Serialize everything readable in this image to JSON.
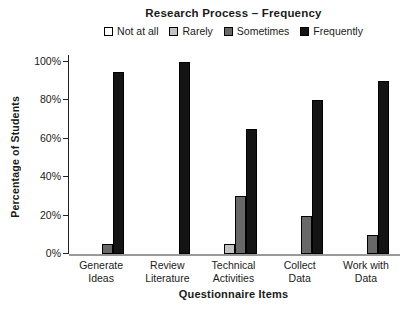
{
  "title": "Research Process – Frequency",
  "legend": [
    {
      "label": "Not at all",
      "color": "#ffffff"
    },
    {
      "label": "Rarely",
      "color": "#c2c2c2"
    },
    {
      "label": "Sometimes",
      "color": "#686868"
    },
    {
      "label": "Frequently",
      "color": "#141414"
    }
  ],
  "categories_lines": [
    [
      "Generate",
      "Ideas"
    ],
    [
      "Review",
      "Literature"
    ],
    [
      "Technical",
      "Activities"
    ],
    [
      "Collect",
      "Data"
    ],
    [
      "Work with",
      "Data"
    ]
  ],
  "chart_data": {
    "type": "bar",
    "title": "Research Process – Frequency",
    "xlabel": "Questionnaire Items",
    "ylabel": "Percentage of Students",
    "categories": [
      "Generate Ideas",
      "Review Literature",
      "Technical Activities",
      "Collect Data",
      "Work with Data"
    ],
    "series": [
      {
        "name": "Not at all",
        "color": "#ffffff",
        "values": [
          0,
          0,
          0,
          0,
          0
        ]
      },
      {
        "name": "Rarely",
        "color": "#c2c2c2",
        "values": [
          0,
          0,
          5,
          0,
          0
        ]
      },
      {
        "name": "Sometimes",
        "color": "#686868",
        "values": [
          5,
          0,
          30,
          20,
          10
        ]
      },
      {
        "name": "Frequently",
        "color": "#141414",
        "values": [
          95,
          100,
          65,
          80,
          90
        ]
      }
    ],
    "ylim": [
      0,
      100
    ],
    "yticks": [
      "0%",
      "20%",
      "40%",
      "60%",
      "80%",
      "100%"
    ],
    "ytick_values": [
      0,
      20,
      40,
      60,
      80,
      100
    ],
    "grid": false,
    "legend_position": "top"
  }
}
